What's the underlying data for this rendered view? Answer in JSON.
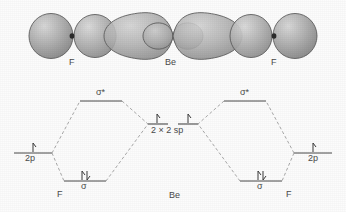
{
  "figure": {
    "background_color": "#fcfcfc"
  },
  "orbital_overlap": {
    "atoms": [
      {
        "label": "F",
        "x": 73,
        "y": 74
      },
      {
        "label": "Be",
        "x": 173,
        "y": 74
      },
      {
        "label": "F",
        "x": 273,
        "y": 74
      }
    ],
    "colors": {
      "lobe_fill_light": "#c8c8c8",
      "lobe_fill_dark": "#8e8e8e",
      "lobe_stroke": "#5a5a5a",
      "nucleus": "#2b2b2b"
    },
    "nuclei": [
      {
        "x": 72,
        "y": 36
      },
      {
        "x": 274,
        "y": 36
      }
    ]
  },
  "mo_diagram": {
    "levels": {
      "left_2p": {
        "label": "2p",
        "electrons": "single-up",
        "x": 30,
        "y": 151
      },
      "left_sigma_star": {
        "label": "σ*",
        "electrons": "none",
        "x": 102,
        "y": 99
      },
      "left_sigma": {
        "label": "σ",
        "electrons": "pair",
        "x": 85,
        "y": 180
      },
      "center": {
        "label": "2 × 2 sp",
        "electrons": "two-single-up",
        "x": 173,
        "y": 131
      },
      "right_sigma_star": {
        "label": "σ*",
        "electrons": "none",
        "x": 245,
        "y": 99
      },
      "right_sigma": {
        "label": "σ",
        "electrons": "pair",
        "x": 262,
        "y": 180
      },
      "right_2p": {
        "label": "2p",
        "electrons": "single-up",
        "x": 317,
        "y": 151
      }
    },
    "atom_labels": [
      {
        "label": "F",
        "x": 60,
        "y": 196
      },
      {
        "label": "Be",
        "x": 175,
        "y": 197
      },
      {
        "label": "F",
        "x": 289,
        "y": 196
      }
    ],
    "colors": {
      "level_line": "#4a4a4a",
      "correlation_line": "#9a9a9a",
      "arrow": "#3a3a3a",
      "text": "#4a4a4a"
    }
  },
  "legend": {
    "sigma_star_symbol": "σ*",
    "sigma_symbol": "σ",
    "sp_label": "2 × 2 sp",
    "p_label": "2p",
    "fluorine_symbol": "F",
    "beryllium_symbol": "Be"
  }
}
